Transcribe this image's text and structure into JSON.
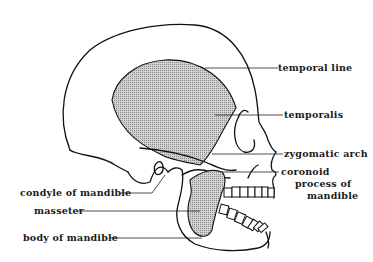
{
  "figure": {
    "colors": {
      "ink": "#111111",
      "muscle_fill": "#b8b8b8",
      "background": "#ffffff"
    },
    "labels": {
      "temporal_line": "temporal line",
      "temporalis": "temporalis",
      "zygomatic_arch": "zygomatic arch",
      "coronoid_line1": "coronoid",
      "coronoid_line2": "process of",
      "coronoid_line3": "mandible",
      "condyle": "condyle of mandible",
      "masseter": "masseter",
      "body_of_mandible": "body of mandible"
    }
  }
}
